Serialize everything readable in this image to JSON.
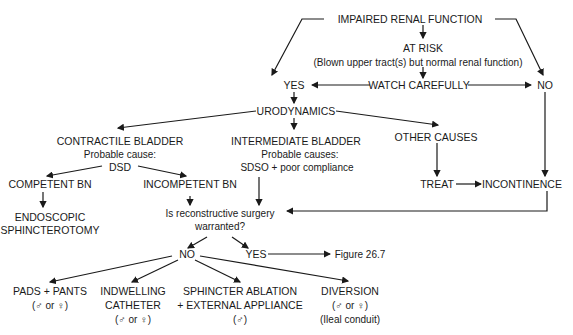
{
  "nodes": {
    "impaired": "IMPAIRED RENAL FUNCTION",
    "at_risk": "AT RISK",
    "at_risk_sub": "(Blown upper tract(s) but normal renal function)",
    "yes_top": "YES",
    "watch": "WATCH CAREFULLY",
    "no_top": "NO",
    "urodynamics": "URODYNAMICS",
    "contractile": "CONTRACTILE BLADDER",
    "contractile_cause": "Probable cause:",
    "dsd": "DSD",
    "intermediate": "INTERMEDIATE BLADDER",
    "intermediate_causes": "Probable causes:",
    "intermediate_sub": "SDSO + poor compliance",
    "other": "OTHER CAUSES",
    "treat": "TREAT",
    "incontinence": "INCONTINENCE",
    "competent": "COMPETENT BN",
    "incompetent": "INCOMPETENT BN",
    "endoscopic1": "ENDOSCOPIC",
    "endoscopic2": "SPHINCTEROTOMY",
    "question1": "Is reconstructive surgery",
    "question2": "warranted?",
    "no_mid": "NO",
    "yes_mid": "YES",
    "figure": "Figure 26.7",
    "pads1": "PADS + PANTS",
    "pads2": "(♂ or ♀)",
    "indwelling1": "INDWELLING",
    "indwelling2": "CATHETER",
    "indwelling3": "(♂ or ♀)",
    "sphincter1": "SPHINCTER ABLATION",
    "sphincter2": "+ EXTERNAL APPLIANCE",
    "sphincter3": "(♂)",
    "diversion1": "DIVERSION",
    "diversion2": "(♂ or ♀)",
    "diversion3": "(Ileal conduit)"
  }
}
